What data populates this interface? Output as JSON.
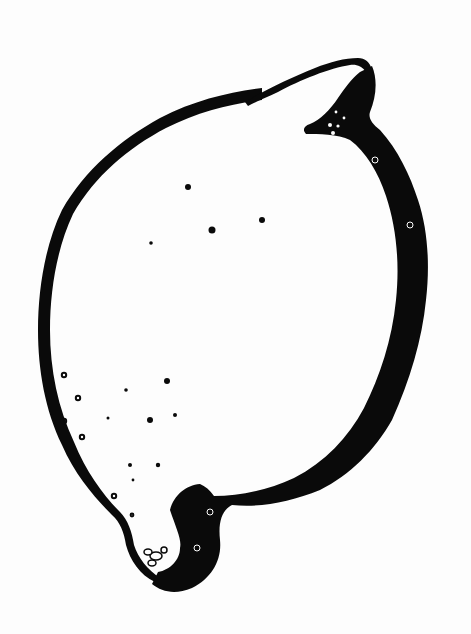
{
  "artwork": {
    "subject": "lemon",
    "style": "black and white woodcut print",
    "colors": {
      "ink": "#0a0a0a",
      "paper": "#fdfdfd"
    }
  }
}
